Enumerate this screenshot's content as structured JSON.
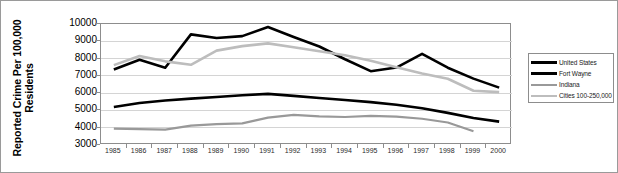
{
  "chart_data": {
    "type": "line",
    "title": "",
    "xlabel": "",
    "ylabel": "Reported Crime Per 100,000 Residents",
    "ylabel_lines": [
      "Reported Crime Per 100,000",
      "Residents"
    ],
    "x": [
      1985,
      1986,
      1987,
      1988,
      1989,
      1990,
      1991,
      1992,
      1993,
      1994,
      1995,
      1996,
      1997,
      1998,
      1999,
      2000
    ],
    "categories": [
      "1985",
      "1986",
      "1987",
      "1988",
      "1989",
      "1990",
      "1991",
      "1992",
      "1993",
      "1994",
      "1995",
      "1996",
      "1997",
      "1998",
      "1999",
      "2000"
    ],
    "ylim": [
      3000,
      10000
    ],
    "yticks": [
      3000,
      4000,
      5000,
      6000,
      7000,
      8000,
      9000,
      10000
    ],
    "ytick_labels": [
      "3000",
      "4000",
      "5000",
      "6000",
      "7000",
      "8000",
      "9000",
      "10000"
    ],
    "grid": true,
    "grid_axis": "y",
    "legend_position": "right-outside",
    "series": [
      {
        "name": "United States",
        "color": "#000000",
        "width": 2.6,
        "values": [
          7370,
          7930,
          7470,
          9400,
          9190,
          9300,
          9830,
          9250,
          8700,
          7960,
          7270,
          7480,
          8270,
          7470,
          6840,
          6320
        ]
      },
      {
        "name": "Fort Wayne",
        "color": "#000000",
        "width": 2.6,
        "values": [
          5200,
          5430,
          5570,
          5680,
          5780,
          5880,
          5960,
          5840,
          5720,
          5600,
          5480,
          5330,
          5130,
          4860,
          4560,
          4350
        ]
      },
      {
        "name": "Indiana",
        "color": "#999999",
        "width": 2.2,
        "values": [
          3950,
          3920,
          3890,
          4120,
          4210,
          4250,
          4580,
          4740,
          4660,
          4620,
          4680,
          4640,
          4520,
          4300,
          3800,
          null
        ]
      },
      {
        "name": "Cities 100-250,000",
        "color": "#bdbdbd",
        "width": 2.6,
        "values": [
          7620,
          8150,
          7840,
          7640,
          8460,
          8720,
          8880,
          8650,
          8420,
          8190,
          7880,
          7500,
          7140,
          6830,
          6140,
          6060
        ]
      }
    ]
  },
  "legend": {
    "items": [
      {
        "label": "United States",
        "color": "#000000",
        "thickness": "3px"
      },
      {
        "label": "Fort Wayne",
        "color": "#000000",
        "thickness": "3px"
      },
      {
        "label": "Indiana",
        "color": "#999999",
        "thickness": "2px"
      },
      {
        "label": "Cities 100-250,000",
        "color": "#bdbdbd",
        "thickness": "2px"
      }
    ]
  },
  "colors": {
    "frame": "#8d8d8d",
    "grid": "#d4d4d4",
    "background": "#ffffff",
    "text": "#000000"
  }
}
